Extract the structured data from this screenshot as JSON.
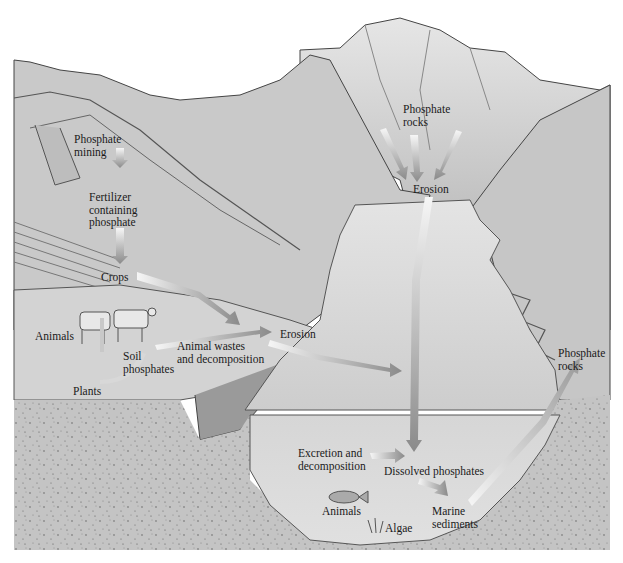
{
  "diagram": {
    "colors": {
      "sky": "#ffffff",
      "land": "#cfcfcf",
      "land_dark": "#9a9a9a",
      "mountain": "#c4c4c4",
      "water": "#dedede",
      "sediment": "#c2c2c2",
      "arrow_light": "#f2f2f2",
      "arrow_dark": "#8a8a8a",
      "outline": "#444444"
    },
    "labels": {
      "phosphate_mining": "Phosphate\nmining",
      "fertilizer": "Fertilizer\ncontaining\nphosphate",
      "crops": "Crops",
      "animals_land": "Animals",
      "soil_phosphates": "Soil\nphosphates",
      "plants": "Plants",
      "animal_wastes": "Animal wastes\nand decomposition",
      "erosion_land": "Erosion",
      "phosphate_rocks_top": "Phosphate\nrocks",
      "erosion_mountain": "Erosion",
      "phosphate_rocks_right": "Phosphate\nrocks",
      "excretion": "Excretion and\ndecomposition",
      "dissolved_phosphates": "Dissolved phosphates",
      "animals_marine": "Animals",
      "algae": "Algae",
      "marine_sediments": "Marine\nsediments"
    },
    "flows": [
      {
        "from": "Phosphate mining",
        "to": "Fertilizer containing phosphate"
      },
      {
        "from": "Fertilizer containing phosphate",
        "to": "Crops"
      },
      {
        "from": "Crops",
        "to": "Erosion"
      },
      {
        "from": "Animals",
        "to": "Soil phosphates"
      },
      {
        "from": "Soil phosphates",
        "to": "Plants"
      },
      {
        "from": "Plants",
        "to": "Animals"
      },
      {
        "from": "Animal wastes and decomposition",
        "to": "Dissolved phosphates"
      },
      {
        "from": "Erosion",
        "to": "Dissolved phosphates"
      },
      {
        "from": "Phosphate rocks",
        "to": "Erosion"
      },
      {
        "from": "Erosion",
        "to": "Dissolved phosphates"
      },
      {
        "from": "Excretion and decomposition",
        "to": "Dissolved phosphates"
      },
      {
        "from": "Dissolved phosphates",
        "to": "Algae"
      },
      {
        "from": "Algae",
        "to": "Animals"
      },
      {
        "from": "Animals",
        "to": "Excretion and decomposition"
      },
      {
        "from": "Dissolved phosphates",
        "to": "Marine sediments"
      },
      {
        "from": "Marine sediments",
        "to": "Phosphate rocks"
      }
    ]
  }
}
